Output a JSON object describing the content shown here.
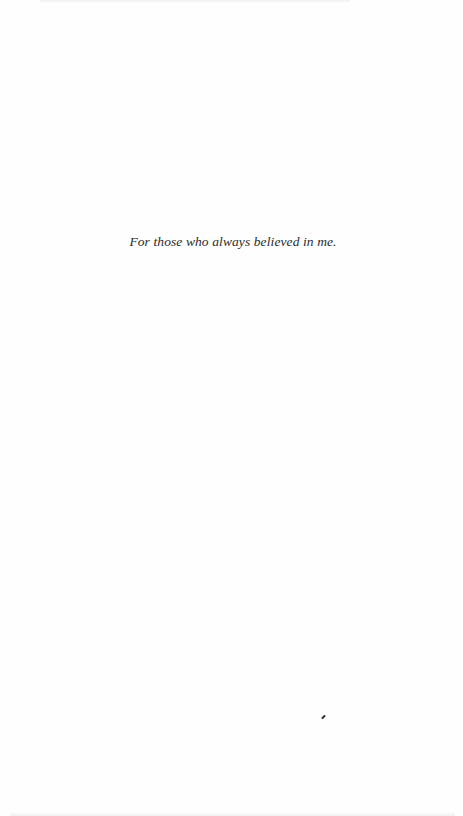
{
  "page": {
    "dedication": "For those who always believed in me."
  },
  "colors": {
    "background": "#fefefe",
    "text": "#2a2a2a"
  }
}
